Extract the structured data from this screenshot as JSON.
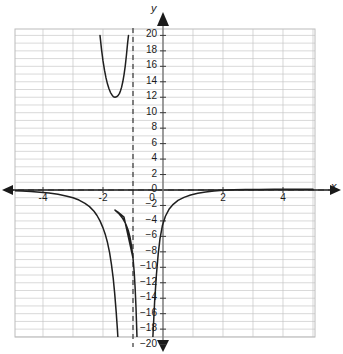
{
  "axes": {
    "x_axis_name": "x",
    "y_axis_name": "y"
  },
  "chart_data": {
    "type": "line",
    "title": "",
    "xlabel": "x",
    "ylabel": "y",
    "xlim": [
      -5,
      5
    ],
    "ylim": [
      -20,
      20
    ],
    "grid": true,
    "legend": "none",
    "x_tick_labels": [
      "-4",
      "-2",
      "0",
      "2",
      "4"
    ],
    "x_tick_values": [
      -4,
      -2,
      0,
      2,
      4
    ],
    "y_tick_labels": [
      "20",
      "18",
      "16",
      "14",
      "12",
      "10",
      "8",
      "6",
      "4",
      "2",
      "0",
      "−2",
      "−4",
      "−6",
      "−8",
      "−10",
      "−12",
      "−14",
      "−16",
      "−18",
      "−20"
    ],
    "y_tick_values": [
      20,
      18,
      16,
      14,
      12,
      10,
      8,
      6,
      4,
      2,
      0,
      -2,
      -4,
      -6,
      -8,
      -10,
      -12,
      -14,
      -16,
      -18,
      -20
    ],
    "x_minor_step": 1,
    "y_minor_step": 1,
    "asymptotes": [
      {
        "name": "vertical-asymptote",
        "orientation": "vertical",
        "value": -1,
        "style": "dashed"
      },
      {
        "name": "horizontal-asymptote",
        "orientation": "horizontal",
        "value": 0,
        "style": "dashed"
      }
    ],
    "series": [
      {
        "name": "upper-left-branch",
        "points": [
          [
            -2.1,
            20.0
          ],
          [
            -2.05,
            18.2
          ],
          [
            -2.0,
            16.7
          ],
          [
            -1.95,
            15.5
          ],
          [
            -1.9,
            14.5
          ],
          [
            -1.85,
            13.7
          ],
          [
            -1.8,
            13.1
          ],
          [
            -1.75,
            12.6
          ],
          [
            -1.7,
            12.3
          ],
          [
            -1.65,
            12.05
          ],
          [
            -1.6,
            12.0
          ],
          [
            -1.55,
            12.05
          ],
          [
            -1.5,
            12.2
          ],
          [
            -1.45,
            12.5
          ],
          [
            -1.42,
            12.8
          ],
          [
            -1.38,
            13.3
          ],
          [
            -1.34,
            14.0
          ],
          [
            -1.3,
            14.9
          ],
          [
            -1.26,
            16.0
          ],
          [
            -1.22,
            17.4
          ],
          [
            -1.18,
            19.0
          ],
          [
            -1.15,
            20.0
          ]
        ]
      },
      {
        "name": "left-descending-branch",
        "points": [
          [
            -5.0,
            -0.1
          ],
          [
            -4.7,
            -0.14
          ],
          [
            -4.4,
            -0.2
          ],
          [
            -4.1,
            -0.28
          ],
          [
            -3.8,
            -0.4
          ],
          [
            -3.5,
            -0.56
          ],
          [
            -3.2,
            -0.8
          ],
          [
            -3.0,
            -1.0
          ],
          [
            -2.8,
            -1.3
          ],
          [
            -2.6,
            -1.72
          ],
          [
            -2.45,
            -2.15
          ],
          [
            -2.3,
            -2.75
          ],
          [
            -2.2,
            -3.3
          ],
          [
            -2.1,
            -4.0
          ],
          [
            -2.0,
            -4.9
          ],
          [
            -1.92,
            -5.8
          ],
          [
            -1.85,
            -6.8
          ],
          [
            -1.78,
            -8.1
          ],
          [
            -1.72,
            -9.6
          ],
          [
            -1.66,
            -11.4
          ],
          [
            -1.61,
            -13.4
          ],
          [
            -1.56,
            -15.8
          ],
          [
            -1.52,
            -18.0
          ],
          [
            -1.49,
            -20.0
          ]
        ]
      },
      {
        "name": "right-ascending-branch",
        "points": [
          [
            -0.86,
            -20.0
          ],
          [
            -0.88,
            -17.5
          ],
          [
            -0.9,
            -15.2
          ],
          [
            -0.93,
            -12.6
          ],
          [
            -0.96,
            -10.6
          ],
          [
            -1.0,
            -8.8
          ],
          [
            -1.05,
            -7.2
          ],
          [
            -1.1,
            -6.1
          ],
          [
            -1.16,
            -5.2
          ],
          [
            -1.24,
            -4.4
          ],
          [
            -1.34,
            -3.7
          ],
          [
            -1.46,
            -3.1
          ],
          [
            -1.6,
            -2.6
          ],
          [
            -1.5,
            -2.85
          ],
          [
            -1.3,
            -3.5
          ],
          [
            -1.0,
            -8.8
          ]
        ]
      },
      {
        "name": "right-branch",
        "points": [
          [
            -0.35,
            -20.0
          ],
          [
            -0.28,
            -14.5
          ],
          [
            -0.22,
            -11.0
          ],
          [
            -0.16,
            -8.3
          ],
          [
            -0.1,
            -6.3
          ],
          [
            -0.02,
            -4.6
          ],
          [
            0.08,
            -3.4
          ],
          [
            0.2,
            -2.5
          ],
          [
            0.34,
            -1.85
          ],
          [
            0.5,
            -1.35
          ],
          [
            0.7,
            -0.95
          ],
          [
            0.92,
            -0.65
          ],
          [
            1.16,
            -0.43
          ],
          [
            1.42,
            -0.27
          ],
          [
            1.7,
            -0.14
          ],
          [
            2.0,
            -0.04
          ],
          [
            2.35,
            0.02
          ],
          [
            2.75,
            0.06
          ],
          [
            3.2,
            0.08
          ],
          [
            3.7,
            0.09
          ],
          [
            4.25,
            0.1
          ],
          [
            4.8,
            0.1
          ],
          [
            5.0,
            0.1
          ]
        ]
      }
    ]
  }
}
